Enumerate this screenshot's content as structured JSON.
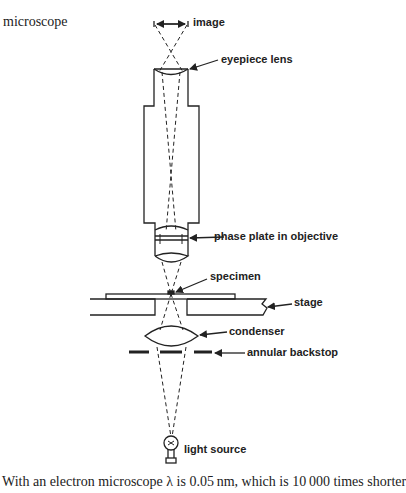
{
  "page": {
    "running_head": "microscope",
    "body_text": "With an electron microscope λ is 0.05 nm, which is 10 000 times shorter"
  },
  "diagram": {
    "type": "phase-contrast microscope optical path",
    "labels": {
      "image": "image",
      "eyepiece_lens": "eyepiece lens",
      "phase_plate": "phase plate in objective",
      "specimen": "specimen",
      "stage": "stage",
      "condenser": "condenser",
      "annular_backstop": "annular backstop",
      "light_source": "light source"
    },
    "colors": {
      "ink": "#222222",
      "background": "#ffffff"
    }
  }
}
